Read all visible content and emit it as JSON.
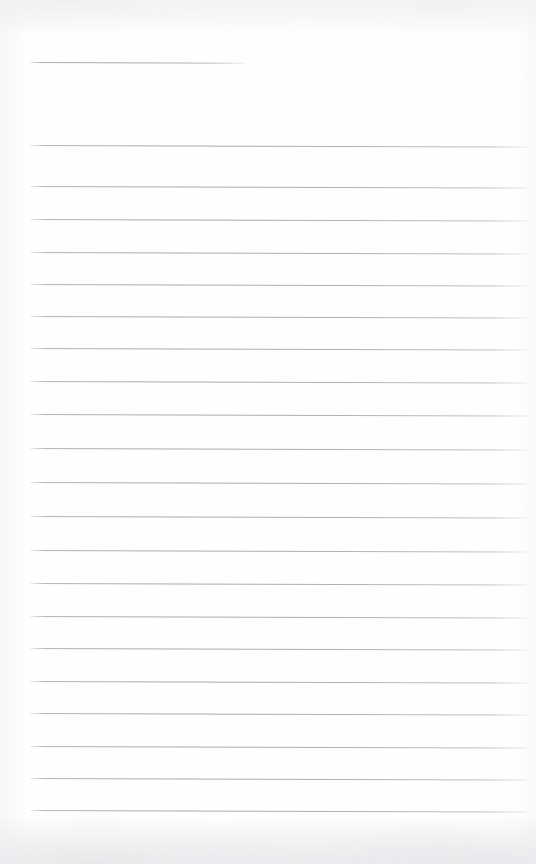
{
  "document": {
    "kind": "lined-notebook-paper-scan",
    "title": "",
    "body_text": "",
    "page_number": "",
    "width": 536,
    "height": 864,
    "background_color": "#fefefe",
    "rule_color": "#acacb5",
    "margin_color": "",
    "is_blank": true
  },
  "ruling": {
    "left_margin_x": 30,
    "right_margin_x": 527,
    "line_thickness": 1,
    "line_spacing": 32.6,
    "tilt_degrees": 0.18,
    "line_count": 23,
    "lines": [
      {
        "index": 1,
        "y": 62,
        "x_start": 30,
        "x_end": 245,
        "partial": true
      },
      {
        "index": 2,
        "y": 145,
        "x_start": 30,
        "x_end": 527,
        "partial": false
      },
      {
        "index": 3,
        "y": 186,
        "x_start": 30,
        "x_end": 527,
        "partial": false
      },
      {
        "index": 4,
        "y": 219,
        "x_start": 30,
        "x_end": 527,
        "partial": false
      },
      {
        "index": 5,
        "y": 252,
        "x_start": 30,
        "x_end": 527,
        "partial": false
      },
      {
        "index": 6,
        "y": 284,
        "x_start": 30,
        "x_end": 527,
        "partial": false
      },
      {
        "index": 7,
        "y": 316,
        "x_start": 30,
        "x_end": 527,
        "partial": false
      },
      {
        "index": 8,
        "y": 348,
        "x_start": 30,
        "x_end": 527,
        "partial": false
      },
      {
        "index": 9,
        "y": 381,
        "x_start": 30,
        "x_end": 527,
        "partial": false
      },
      {
        "index": 10,
        "y": 414,
        "x_start": 30,
        "x_end": 527,
        "partial": false
      },
      {
        "index": 11,
        "y": 448,
        "x_start": 30,
        "x_end": 527,
        "partial": false
      },
      {
        "index": 12,
        "y": 482,
        "x_start": 30,
        "x_end": 527,
        "partial": false
      },
      {
        "index": 13,
        "y": 516,
        "x_start": 30,
        "x_end": 527,
        "partial": false
      },
      {
        "index": 14,
        "y": 550,
        "x_start": 30,
        "x_end": 527,
        "partial": false
      },
      {
        "index": 15,
        "y": 583,
        "x_start": 30,
        "x_end": 527,
        "partial": false
      },
      {
        "index": 16,
        "y": 616,
        "x_start": 30,
        "x_end": 527,
        "partial": false
      },
      {
        "index": 17,
        "y": 648,
        "x_start": 30,
        "x_end": 527,
        "partial": false
      },
      {
        "index": 18,
        "y": 681,
        "x_start": 30,
        "x_end": 527,
        "partial": false
      },
      {
        "index": 19,
        "y": 713,
        "x_start": 30,
        "x_end": 527,
        "partial": false
      },
      {
        "index": 20,
        "y": 746,
        "x_start": 30,
        "x_end": 527,
        "partial": false
      },
      {
        "index": 21,
        "y": 778,
        "x_start": 30,
        "x_end": 527,
        "partial": false
      },
      {
        "index": 22,
        "y": 810,
        "x_start": 30,
        "x_end": 527,
        "partial": false
      }
    ]
  }
}
